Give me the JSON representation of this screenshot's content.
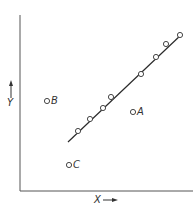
{
  "diagram": {
    "x_axis_label": "X",
    "y_axis_label": "Y",
    "line_points": [
      [
        78,
        131
      ],
      [
        90,
        119
      ],
      [
        103,
        108
      ],
      [
        111,
        97
      ],
      [
        141,
        74
      ],
      [
        156,
        57
      ],
      [
        166,
        44
      ],
      [
        180,
        35
      ]
    ],
    "fit_line": {
      "x1": 68,
      "y1": 142,
      "x2": 182,
      "y2": 34
    },
    "outliers": [
      {
        "label": "A",
        "x": 133,
        "y": 112
      },
      {
        "label": "B",
        "x": 47,
        "y": 101
      },
      {
        "label": "C",
        "x": 69,
        "y": 165
      }
    ],
    "colors": {
      "ink": "#2a2a2a",
      "background": "#ffffff"
    }
  }
}
